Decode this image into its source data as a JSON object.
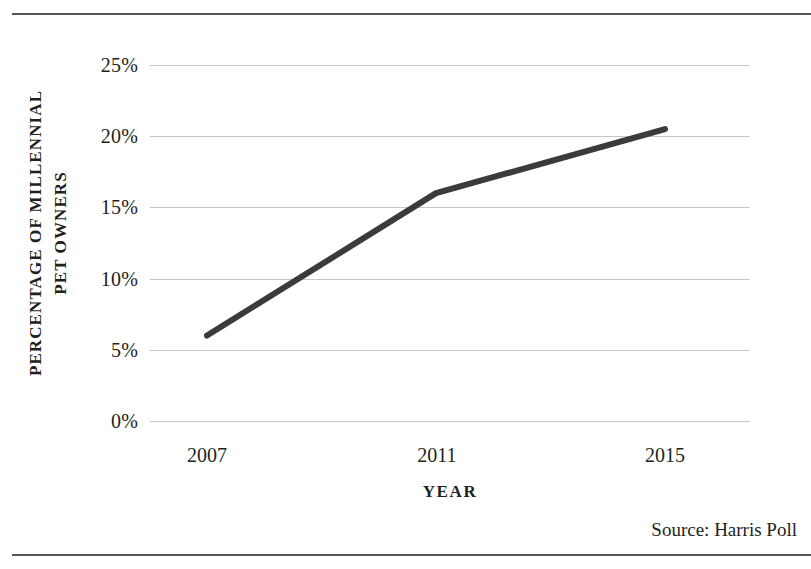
{
  "chart_data": {
    "type": "line",
    "title": "",
    "xlabel": "YEAR",
    "ylabel": "PERCENTAGE OF MILLENNIAL PET OWNERS",
    "ylabel_lines": [
      "PERCENTAGE OF MILLENNIAL",
      "PET OWNERS"
    ],
    "categories": [
      "2007",
      "2011",
      "2015"
    ],
    "x": [
      2007,
      2011,
      2015
    ],
    "values": [
      6,
      16,
      20.5
    ],
    "series": [
      {
        "name": "Percentage of millennial pet owners",
        "values": [
          6,
          16,
          20.5
        ]
      }
    ],
    "ylim": [
      0,
      25
    ],
    "xlim": [
      2007,
      2015
    ],
    "yticks": [
      0,
      5,
      10,
      15,
      20,
      25
    ],
    "ytick_labels": [
      "0%",
      "5%",
      "10%",
      "15%",
      "20%",
      "25%"
    ],
    "xtick_labels": [
      "2007",
      "2011",
      "2015"
    ],
    "grid": "horizontal",
    "legend": "none",
    "line_color": "#3b3b3b",
    "line_width": 6,
    "gridline_color": "#c6c7c9",
    "background_color": "#ffffff",
    "text_color": "#231f20"
  },
  "source": {
    "text": "Source: Harris Poll"
  },
  "frame": {
    "rule_color": "#55565a"
  }
}
